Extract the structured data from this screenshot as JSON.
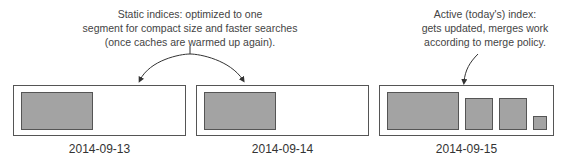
{
  "notes": {
    "static": {
      "lines": [
        "Static indices: optimized to one",
        "segment for compact size and faster searches",
        "(once caches are warmed up again)."
      ]
    },
    "active": {
      "lines": [
        "Active (today's) index:",
        "gets updated, merges work",
        "according to merge policy."
      ]
    }
  },
  "indices": [
    {
      "date": "2014-09-13",
      "type": "static",
      "segments": 1
    },
    {
      "date": "2014-09-14",
      "type": "static",
      "segments": 1
    },
    {
      "date": "2014-09-15",
      "type": "active",
      "segments": 4
    }
  ],
  "colors": {
    "segment_fill": "#a3a3a3",
    "border": "#555555",
    "text": "#333333"
  }
}
